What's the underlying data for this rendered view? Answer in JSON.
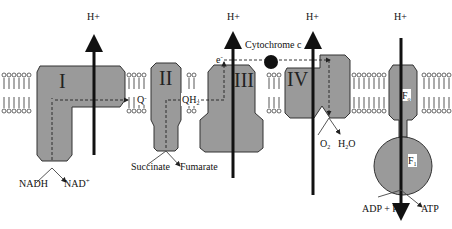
{
  "proton_label": "H+",
  "complexes": [
    {
      "id": "I",
      "label": "I"
    },
    {
      "id": "II",
      "label": "II"
    },
    {
      "id": "III",
      "label": "III"
    },
    {
      "id": "IV",
      "label": "IV"
    },
    {
      "id": "F0",
      "label": "F",
      "sub": "o"
    },
    {
      "id": "F1",
      "label": "F",
      "sub": "1"
    }
  ],
  "carriers": {
    "q": "Q",
    "q_superscript": "-",
    "qh2": "QH",
    "qh2_sub": "2",
    "cytochrome": "Cytochrome c",
    "electron": "e",
    "electron_superscript": "-"
  },
  "substrates": {
    "nadh": "NADH",
    "nad": "NAD",
    "nad_sup": "+",
    "succinate": "Succinate",
    "fumarate": "Fumarate",
    "o2": "O",
    "o2_sub": "2",
    "h2o_h": "H",
    "h2o_sub": "2",
    "h2o_o": "O",
    "adp": "ADP + P",
    "adp_sub": "i",
    "atp": "ATP"
  },
  "colors": {
    "complex_fill": "#9a9a9a",
    "arrow": "#111111",
    "membrane": "#444444"
  }
}
